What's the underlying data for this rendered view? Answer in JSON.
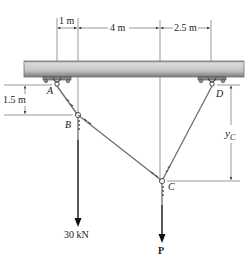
{
  "diagram": {
    "title": "",
    "dimensions": {
      "top_1": "1 m",
      "top_2": "4 m",
      "top_3": "2.5 m",
      "left_vertical": "1.5 m",
      "right_vertical_var": "y",
      "right_vertical_sub": "C"
    },
    "points": {
      "A": "A",
      "B": "B",
      "C": "C",
      "D": "D"
    },
    "loads": {
      "B_load": "30 kN",
      "C_load": "P"
    },
    "colors": {
      "beam_fill": "#cfcfcf",
      "beam_edge": "#6f6f6f",
      "cable": "#6e6e6e",
      "dimension_line": "#333333",
      "arrow": "#111111"
    }
  }
}
